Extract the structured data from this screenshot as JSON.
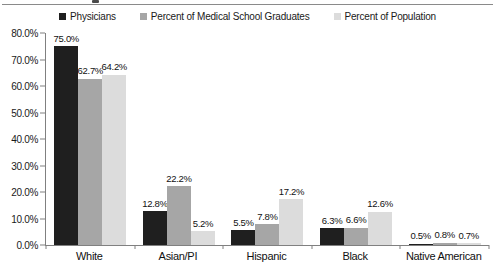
{
  "figure": {
    "top_rule_color": "#8a8a8a",
    "axis_color": "#808080",
    "background": "#ffffff",
    "text_color": "#111111"
  },
  "chart_data": {
    "type": "bar",
    "title": "",
    "xlabel": "",
    "ylabel": "",
    "categories": [
      "White",
      "Asian/PI",
      "Hispanic",
      "Black",
      "Native American"
    ],
    "series": [
      {
        "name": "Physicians",
        "color": "#1f1f1f",
        "values": [
          75.0,
          12.8,
          5.5,
          6.3,
          0.5
        ]
      },
      {
        "name": "Percent of Medical School Graduates",
        "color": "#a6a6a6",
        "values": [
          62.7,
          22.2,
          7.8,
          6.6,
          0.8
        ]
      },
      {
        "name": "Percent of Population",
        "color": "#dcdcdc",
        "values": [
          64.2,
          5.2,
          17.2,
          12.6,
          0.7
        ]
      }
    ],
    "y_ticks": [
      "80.0%",
      "70.0%",
      "60.0%",
      "50.0%",
      "40.0%",
      "30.0%",
      "20.0%",
      "10.0%",
      "0.0%"
    ],
    "ylim": [
      0,
      80
    ],
    "data_labels": [
      [
        "75.0%",
        "12.8%",
        "5.5%",
        "6.3%",
        "0.5%"
      ],
      [
        "62.7%",
        "22.2%",
        "7.8%",
        "6.6%",
        "0.8%"
      ],
      [
        "64.2%",
        "5.2%",
        "17.2%",
        "12.6%",
        "0.7%"
      ]
    ],
    "grid": false,
    "legend_position": "top"
  }
}
